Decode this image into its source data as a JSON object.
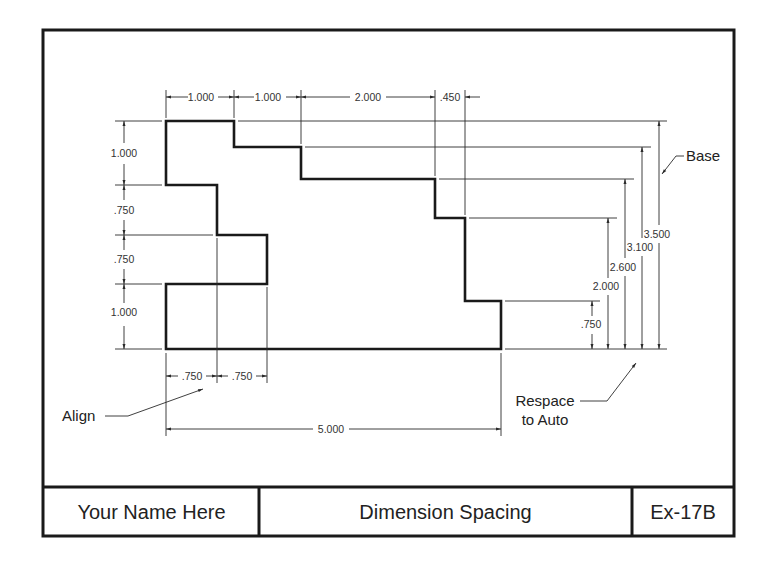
{
  "drawing": {
    "title_block": {
      "name": "Your Name Here",
      "title": "Dimension Spacing",
      "exercise": "Ex-17B"
    },
    "annotations": {
      "base": "Base",
      "align": "Align",
      "respace_line1": "Respace",
      "respace_line2": "to Auto"
    },
    "top_dimensions": [
      "1.000",
      "1.000",
      "2.000",
      ".450"
    ],
    "left_dimensions": [
      "1.000",
      ".750",
      ".750",
      "1.000"
    ],
    "bottom_dimensions": [
      ".750",
      ".750"
    ],
    "overall_width": "5.000",
    "right_baseline_dimensions": [
      ".750",
      "2.000",
      "2.600",
      "3.100",
      "3.500"
    ],
    "colors": {
      "line": "#1a1a1a",
      "text": "#333333",
      "background": "#ffffff"
    }
  }
}
